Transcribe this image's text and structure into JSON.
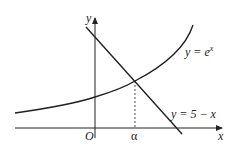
{
  "diagram": {
    "title": "",
    "axes": {
      "x_label": "x",
      "y_label": "y",
      "origin_label": "O"
    },
    "curves": [
      {
        "name": "exponential",
        "label": "y = e",
        "superscript": "x"
      },
      {
        "name": "line",
        "label": "y = 5 − x"
      }
    ],
    "intersection_label": "α",
    "colors": {
      "ink": "#222222",
      "background": "#ffffff"
    }
  }
}
